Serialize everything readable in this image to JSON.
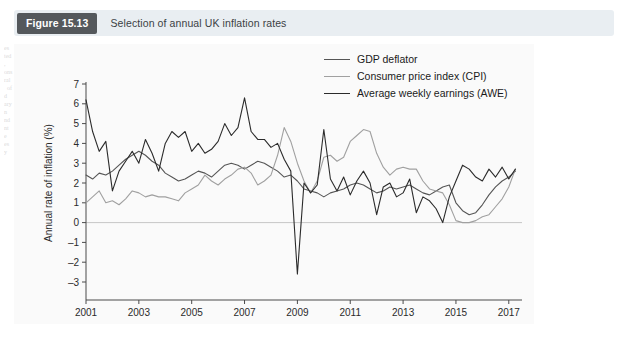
{
  "figure": {
    "tag": "Figure 15.13",
    "caption": "Selection of annual UK inflation rates"
  },
  "page_bleed": {
    "left": "es\nted\n,\nons\nral\n  of\nd\nary\nn\nnd\nnt\ne\nes\ny",
    "right": "mic Outlook is\nconsumer\nthis, the debt\nme and\nbudget\nUS, a\nJapan\n\nONOMY\n\non, the\nof\nervices.\nth of\nices. Here,\nation. In\nxes and"
  },
  "legend": {
    "position": "top-center",
    "items": [
      {
        "label": "GDP deflator",
        "color": "#555555"
      },
      {
        "label": "Consumer price index (CPI)",
        "color": "#a0a0a0"
      },
      {
        "label": "Average weekly earnings (AWE)",
        "color": "#2b2b2b"
      }
    ]
  },
  "chart_data": {
    "type": "line",
    "title": "Selection of annual UK inflation rates",
    "xlabel": "",
    "ylabel": "Annual rate of inflation (%)",
    "xlim": [
      2001,
      2017.5
    ],
    "ylim": [
      -3,
      7
    ],
    "yticks": [
      -3,
      -2,
      -1,
      0,
      1,
      2,
      3,
      4,
      5,
      6,
      7
    ],
    "xticks": [
      2001,
      2003,
      2005,
      2007,
      2009,
      2011,
      2013,
      2015,
      2017
    ],
    "grid": false,
    "x": [
      2001.0,
      2001.25,
      2001.5,
      2001.75,
      2002.0,
      2002.25,
      2002.5,
      2002.75,
      2003.0,
      2003.25,
      2003.5,
      2003.75,
      2004.0,
      2004.25,
      2004.5,
      2004.75,
      2005.0,
      2005.25,
      2005.5,
      2005.75,
      2006.0,
      2006.25,
      2006.5,
      2006.75,
      2007.0,
      2007.25,
      2007.5,
      2007.75,
      2008.0,
      2008.25,
      2008.5,
      2008.75,
      2009.0,
      2009.25,
      2009.5,
      2009.75,
      2010.0,
      2010.25,
      2010.5,
      2010.75,
      2011.0,
      2011.25,
      2011.5,
      2011.75,
      2012.0,
      2012.25,
      2012.5,
      2012.75,
      2013.0,
      2013.25,
      2013.5,
      2013.75,
      2014.0,
      2014.25,
      2014.5,
      2014.75,
      2015.0,
      2015.25,
      2015.5,
      2015.75,
      2016.0,
      2016.25,
      2016.5,
      2016.75,
      2017.0,
      2017.25
    ],
    "series": [
      {
        "name": "GDP deflator",
        "color": "#555555",
        "values": [
          2.4,
          2.2,
          2.5,
          2.4,
          2.6,
          2.9,
          3.2,
          3.4,
          3.6,
          3.4,
          3.1,
          2.9,
          2.5,
          2.3,
          2.1,
          2.2,
          2.4,
          2.6,
          2.5,
          2.3,
          2.6,
          2.9,
          3.0,
          2.9,
          2.7,
          2.9,
          3.1,
          3.0,
          2.8,
          2.6,
          2.3,
          2.4,
          2.1,
          1.7,
          1.6,
          1.5,
          1.3,
          1.5,
          1.6,
          1.7,
          1.9,
          2.0,
          1.9,
          1.7,
          1.5,
          1.6,
          1.8,
          1.7,
          1.8,
          1.9,
          1.7,
          1.5,
          1.4,
          1.6,
          1.8,
          1.9,
          1.0,
          0.6,
          0.4,
          0.5,
          0.9,
          1.4,
          1.8,
          2.1,
          2.3,
          2.6
        ]
      },
      {
        "name": "Consumer price index (CPI)",
        "color": "#a0a0a0",
        "values": [
          1.0,
          1.3,
          1.6,
          1.0,
          1.1,
          0.9,
          1.2,
          1.6,
          1.5,
          1.3,
          1.4,
          1.3,
          1.3,
          1.2,
          1.1,
          1.5,
          1.7,
          1.9,
          2.4,
          2.1,
          1.9,
          2.2,
          2.4,
          2.7,
          2.8,
          2.5,
          1.9,
          2.1,
          2.4,
          3.4,
          4.8,
          4.1,
          3.0,
          2.1,
          1.5,
          2.1,
          3.3,
          3.4,
          3.1,
          3.3,
          4.1,
          4.4,
          4.7,
          4.6,
          3.5,
          2.8,
          2.4,
          2.7,
          2.8,
          2.7,
          2.7,
          2.1,
          1.7,
          1.6,
          1.5,
          0.9,
          0.1,
          0.0,
          0.0,
          0.1,
          0.3,
          0.4,
          0.8,
          1.2,
          1.8,
          2.7
        ]
      },
      {
        "name": "Average weekly earnings (AWE)",
        "color": "#2b2b2b",
        "values": [
          6.2,
          4.6,
          3.6,
          4.1,
          1.6,
          2.6,
          3.1,
          3.6,
          3.0,
          4.2,
          3.5,
          2.6,
          4.0,
          4.6,
          4.3,
          4.6,
          3.6,
          4.0,
          3.5,
          3.7,
          4.1,
          5.0,
          4.4,
          4.8,
          6.3,
          4.6,
          4.2,
          4.2,
          3.8,
          4.0,
          3.2,
          2.6,
          -2.6,
          2.0,
          1.5,
          1.9,
          4.7,
          2.2,
          1.6,
          2.3,
          1.4,
          2.1,
          2.6,
          2.0,
          0.4,
          1.8,
          2.0,
          1.3,
          1.5,
          2.2,
          0.5,
          1.3,
          1.1,
          0.7,
          0.0,
          1.3,
          2.1,
          2.9,
          2.7,
          2.3,
          2.1,
          2.7,
          2.3,
          2.8,
          2.2,
          2.7
        ]
      }
    ]
  }
}
